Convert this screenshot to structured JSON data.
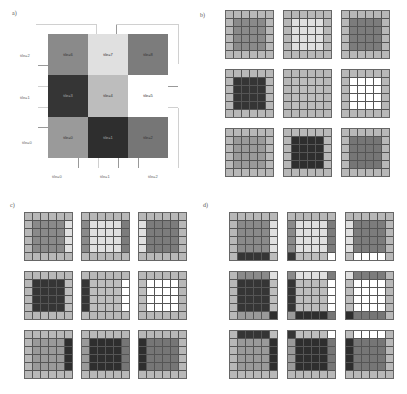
{
  "panels": {
    "a": {
      "label": "a)",
      "row_labels": [
        "tile=2",
        "tile=1",
        "tile=0"
      ],
      "col_labels": [
        "tile=0",
        "tile=1",
        "tile=2"
      ],
      "cells": [
        [
          {
            "label": "tile=6",
            "tile": 6
          },
          {
            "label": "tile=7",
            "tile": 7
          },
          {
            "label": "tile=8",
            "tile": 8
          }
        ],
        [
          {
            "label": "tile=3",
            "tile": 3
          },
          {
            "label": "tile=4",
            "tile": 4
          },
          {
            "label": "tile=5",
            "tile": 5
          }
        ],
        [
          {
            "label": "tile=0",
            "tile": 0
          },
          {
            "label": "tile=1",
            "tile": 1
          },
          {
            "label": "tile=2",
            "tile": 2
          }
        ]
      ]
    },
    "b": {
      "label": "b)",
      "halo_mode": "none"
    },
    "c": {
      "label": "c)",
      "halo_mode": "horizontal"
    },
    "d": {
      "label": "d)",
      "halo_mode": "full"
    }
  },
  "tile_colors": {
    "0": "#9a9a9a",
    "1": "#2e2e2e",
    "2": "#767676",
    "3": "#353535",
    "4": "#bdbdbd",
    "5": "#ffffff",
    "6": "#8a8a8a",
    "7": "#e0e0e0",
    "8": "#7c7c7c"
  },
  "padding_color": "#b8b8b8",
  "tile_layout": [
    [
      6,
      7,
      8
    ],
    [
      3,
      4,
      5
    ],
    [
      0,
      1,
      2
    ]
  ],
  "grid_size": 6,
  "halo_width": 1
}
